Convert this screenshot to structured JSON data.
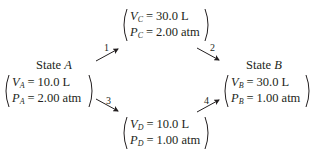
{
  "diagram": {
    "type": "thermodynamic-process-paths",
    "states": {
      "A": {
        "title_prefix": "State",
        "title_letter": "A",
        "volume": {
          "symbol": "V",
          "subscript": "A",
          "value": "10.0 L"
        },
        "pressure": {
          "symbol": "P",
          "subscript": "A",
          "value": "2.00 atm"
        }
      },
      "C": {
        "volume": {
          "symbol": "V",
          "subscript": "C",
          "value": "30.0 L"
        },
        "pressure": {
          "symbol": "P",
          "subscript": "C",
          "value": "2.00 atm"
        }
      },
      "D": {
        "volume": {
          "symbol": "V",
          "subscript": "D",
          "value": "10.0 L"
        },
        "pressure": {
          "symbol": "P",
          "subscript": "D",
          "value": "1.00 atm"
        }
      },
      "B": {
        "title_prefix": "State",
        "title_letter": "B",
        "volume": {
          "symbol": "V",
          "subscript": "B",
          "value": "30.0 L"
        },
        "pressure": {
          "symbol": "P",
          "subscript": "B",
          "value": "1.00 atm"
        }
      }
    },
    "steps": [
      {
        "label": "1",
        "from": "A",
        "to": "C"
      },
      {
        "label": "2",
        "from": "C",
        "to": "B"
      },
      {
        "label": "3",
        "from": "A",
        "to": "D"
      },
      {
        "label": "4",
        "from": "D",
        "to": "B"
      }
    ],
    "colors": {
      "text": "#231f20",
      "background": "#ffffff"
    }
  }
}
